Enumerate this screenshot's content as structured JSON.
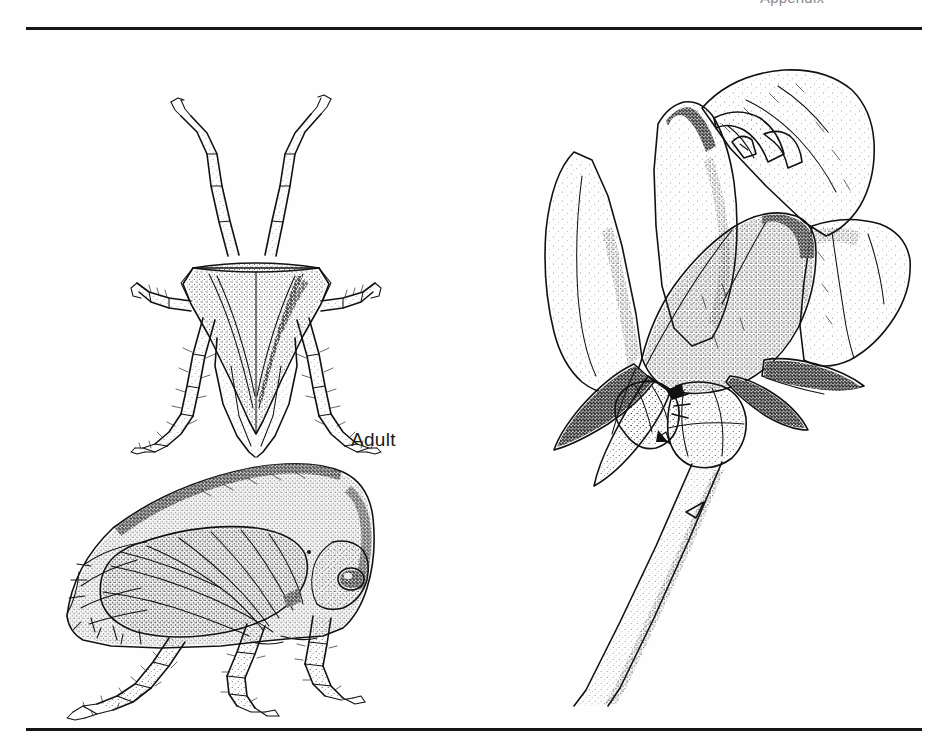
{
  "page": {
    "background_color": "#fefefe",
    "ink_color": "#111111",
    "running_head": "Appendix",
    "rule_color": "#161616"
  },
  "figure": {
    "kind": "scientific-illustration-plate",
    "medium": "pen-and-ink stipple drawing",
    "labels": [
      {
        "text": "Adult",
        "target": "treehopper-adult"
      }
    ],
    "panels": [
      {
        "id": "adult-dorsal",
        "name": "treehopper-adult-dorsal-view",
        "description": "Dorsal view of adult treehopper with raised forelegs, triangular stippled pronotum, folded wings and spined hind legs",
        "label": "Adult"
      },
      {
        "id": "adult-lateral",
        "name": "treehopper-adult-lateral-view",
        "description": "Lateral view of adult treehopper showing humped pronotum, veined forewing, compound eye and legs",
        "label": "Adult"
      },
      {
        "id": "rose-with-insect",
        "name": "rose-bud-with-treehopper",
        "description": "Rose bud in partial bloom on a thorny stem with a single treehopper resting on the stem",
        "label": ""
      }
    ]
  }
}
